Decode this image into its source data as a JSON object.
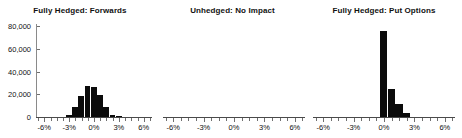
{
  "figure": {
    "panel_count": 3,
    "background_color": "#ffffff",
    "bar_color": "#0b0b0b",
    "axis_color": "#4a4a4a"
  },
  "yaxis": {
    "labels": [
      "80,000",
      "60,000",
      "40,000",
      "20,000",
      "0"
    ],
    "values": [
      80000,
      60000,
      40000,
      20000,
      0
    ],
    "min": 0,
    "max": 80000
  },
  "xaxis": {
    "labels": [
      "-6%",
      "-3%",
      "0%",
      "3%",
      "6%"
    ],
    "values": [
      -6,
      -3,
      0,
      3,
      6
    ],
    "min": -7,
    "max": 7,
    "minor_step": 0.75
  },
  "panels": [
    {
      "title": "Fully Hedged: Forwards"
    },
    {
      "title": "Unhedged: No Impact"
    },
    {
      "title": "Fully Hedged: Put Options"
    }
  ],
  "chart_data": [
    {
      "type": "bar",
      "title": "Fully Hedged: Forwards",
      "xlabel": "",
      "ylabel": "",
      "xlim": [
        -7,
        7
      ],
      "ylim": [
        0,
        80000
      ],
      "xtick_labels": [
        "-6%",
        "-3%",
        "0%",
        "3%",
        "6%"
      ],
      "ytick_labels": [
        "0",
        "20,000",
        "40,000",
        "60,000",
        "80,000"
      ],
      "grid": false,
      "legend": "none",
      "x": [
        -3.0,
        -2.25,
        -1.5,
        -0.75,
        0.0,
        0.75,
        1.5,
        2.25,
        3.0
      ],
      "values": [
        2000,
        8500,
        18500,
        27000,
        26500,
        19500,
        8500,
        2000,
        500
      ],
      "bar_width_pct": 0.75
    },
    {
      "type": "bar",
      "title": "Unhedged: No Impact",
      "xlabel": "",
      "ylabel": "",
      "xlim": [
        -7,
        7
      ],
      "ylim": [
        0,
        80000
      ],
      "xtick_labels": [
        "-6%",
        "-3%",
        "0%",
        "3%",
        "6%"
      ],
      "grid": false,
      "legend": "none",
      "x": [],
      "values": [],
      "note": "empty panel - no bars drawn"
    },
    {
      "type": "bar",
      "title": "Fully Hedged: Put Options",
      "xlabel": "",
      "ylabel": "",
      "xlim": [
        -7,
        7
      ],
      "ylim": [
        0,
        80000
      ],
      "xtick_labels": [
        "-6%",
        "-3%",
        "0%",
        "3%",
        "6%"
      ],
      "grid": false,
      "legend": "none",
      "x": [
        0.0,
        0.75,
        1.5,
        2.25
      ],
      "values": [
        76000,
        25000,
        11000,
        3500
      ],
      "bar_width_pct": 0.75
    }
  ]
}
